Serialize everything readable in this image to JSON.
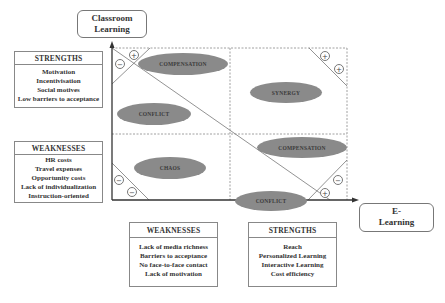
{
  "axes": {
    "y_label": "Classroom Learning",
    "x_label": "E-Learning",
    "y_label_lines": [
      "Classroom",
      "Learning"
    ],
    "x_label_lines": [
      "E-",
      "Learning"
    ]
  },
  "classroom": {
    "strengths": {
      "title": "STRENGTHS",
      "items": [
        "Motivation",
        "Incentivisation",
        "Social motives",
        "Low barriers to acceptance"
      ]
    },
    "weaknesses": {
      "title": "WEAKNESSES",
      "items": [
        "HR costs",
        "Travel expenses",
        "Opportunity costs",
        "Lack of individualization",
        "Instruction-oriented"
      ]
    }
  },
  "elearning": {
    "weaknesses": {
      "title": "WEAKNESSES",
      "items": [
        "Lack of media richness",
        "Barriers to acceptance",
        "No face-to-face contact",
        "Lack of motivation"
      ]
    },
    "strengths": {
      "title": "STRENGTHS",
      "items": [
        "Reach",
        "Personalized Learning",
        "Interactive Learning",
        "Cost efficiency"
      ]
    }
  },
  "quadrants": {
    "top_left_upper": "COMPENSATION",
    "top_left_lower": "CONFLICT",
    "top_right": "SYNERGY",
    "bottom_left": "CHAOS",
    "bottom_right_upper": "COMPENSATION",
    "bottom_right_lower": "CONFLICT"
  },
  "corner_signs": {
    "top_left": [
      "−",
      "+"
    ],
    "top_right": [
      "+",
      "+"
    ],
    "bottom_left": [
      "−",
      "−"
    ],
    "bottom_right": [
      "+",
      "−"
    ]
  },
  "colors": {
    "ellipse_fill": "#8a8a8a",
    "axis_line": "#333333",
    "grid_dash": "#888888"
  }
}
